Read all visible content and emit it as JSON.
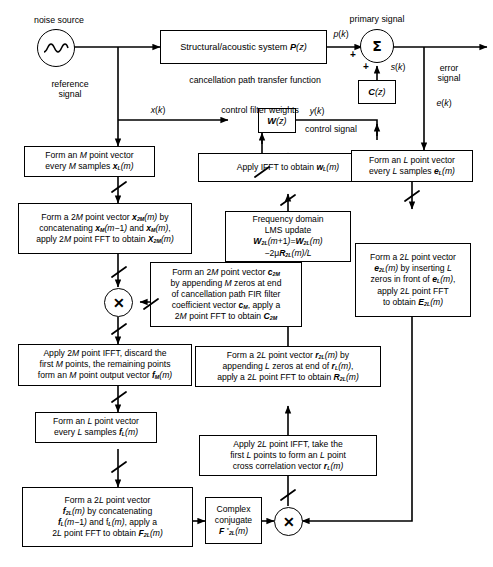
{
  "diagram": {
    "width": 493,
    "height": 567,
    "line_color": "#000000",
    "background": "#ffffff"
  },
  "labels": {
    "noise_source": "noise source",
    "reference_signal": "reference\nsignal",
    "reference_signal_l1": "reference",
    "reference_signal_l2": "signal",
    "primary_signal": "primary signal",
    "error_signal_l1": "error",
    "error_signal_l2": "signal",
    "cancellation_path": "cancellation path transfer function",
    "control_filter_weights": "control filter weights",
    "control_signal": "control signal",
    "x_k": "x(k)",
    "p_k": "p(k)",
    "s_k": "s(k)",
    "y_k": "y(k)",
    "e_k": "e(k)",
    "plus_top": "+",
    "plus_bottom": "+"
  },
  "blocks": {
    "plant": "Structural/acoustic system P(z)",
    "plant_text": "Structural/acoustic system",
    "plant_tf": "P(z)",
    "cancellation_path": "C(z)",
    "control_filter": "W(z)",
    "complex_conjugate_l1": "Complex",
    "complex_conjugate_l2": "conjugate",
    "complex_conjugate_l3": "F *2L(m)"
  },
  "process_boxes": [
    {
      "id": "form-m-point-vector",
      "lines": [
        "Form an M point vector",
        "every M samples xL(m)"
      ]
    },
    {
      "id": "form-2m-point-vector",
      "lines": [
        "Form a 2M point vector x2M(m) by",
        "concatenating xM(m - 1) and xM(m),",
        "apply 2M point FFT to obtain X2M(m)"
      ]
    },
    {
      "id": "cancellation-path-coeff",
      "lines": [
        "Form an 2M point vector c2M",
        "by appending M zeros at end",
        "of cancellation path FIR filter",
        "coefficient vector cM, apply a",
        "2M point FFT to obtain C2M"
      ]
    },
    {
      "id": "apply-2m-ifft",
      "lines": [
        "Apply 2M point IFFT, discard the",
        "first M points, the remaining points",
        "form an M point output vector fM(m)"
      ]
    },
    {
      "id": "form-l-point-vector-f",
      "lines": [
        "Form an L point vector",
        "every L samples fL(m)"
      ]
    },
    {
      "id": "form-2l-point-vector-f",
      "lines": [
        "Form a 2L point vector",
        "f2L(m) by concatenating",
        "fL(m - 1) and fL(m), apply a",
        "2L point FFT to obtain F2L(m)"
      ]
    },
    {
      "id": "apply-ifft-weights",
      "lines": [
        "Apply IFFT to obtain wL(m)"
      ]
    },
    {
      "id": "frequency-domain-lms",
      "lines": [
        "Frequency domain",
        "LMS update",
        "W2L(m+1)=W2L(m)",
        "- 2u R2L(m)/L"
      ]
    },
    {
      "id": "form-2l-point-vector-r",
      "lines": [
        "Form a 2L point vector r2L(m) by",
        "appending L zeros at end of rL(m),",
        "apply a 2L point FFT to obtain R2L(m)"
      ]
    },
    {
      "id": "apply-2l-ifft-xcorr",
      "lines": [
        "Apply 2L point IFFT, take the",
        "first L points to form an L point",
        "cross correlation vector rL(m)"
      ]
    },
    {
      "id": "form-l-point-vector-e",
      "lines": [
        "Form an L point vector",
        "every L samples eL(m)"
      ]
    },
    {
      "id": "form-2l-point-vector-e",
      "lines": [
        "Form a 2L point vector",
        "e2L(m) by inserting L",
        "zeros in front of eL(m),",
        "apply 2L point FFT",
        "to obtain E2L(m)"
      ]
    }
  ],
  "operators": {
    "summing_junction": "sum-sigma",
    "multiplier_upper": "multiply-x",
    "multiplier_lower": "multiply-x"
  }
}
